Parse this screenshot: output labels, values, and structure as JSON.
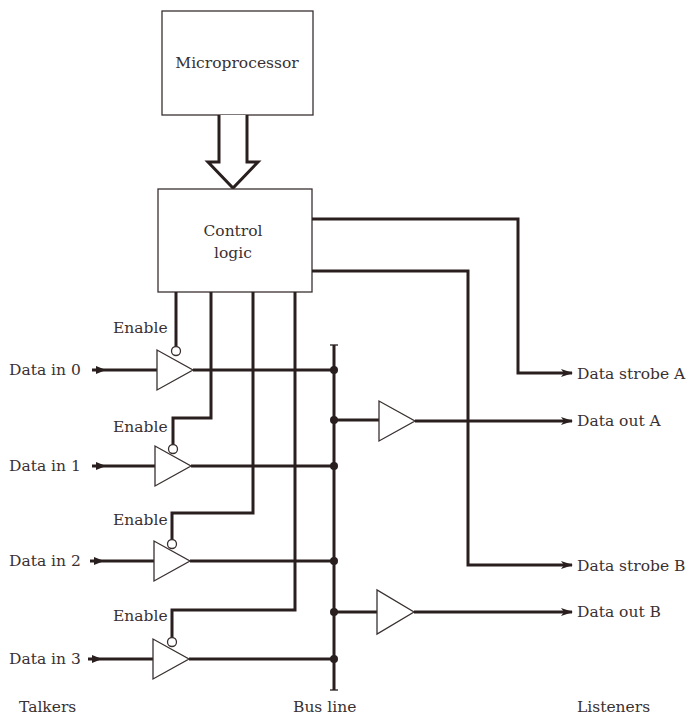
{
  "diagram": {
    "blocks": {
      "microprocessor": "Microprocessor",
      "control_logic_line1": "Control",
      "control_logic_line2": "logic"
    },
    "talkers": {
      "enable_label": "Enable",
      "inputs": [
        "Data in 0",
        "Data in 1",
        "Data in 2",
        "Data in 3"
      ],
      "enable_labels": [
        "Enable",
        "Enable",
        "Enable",
        "Enable"
      ]
    },
    "listeners": {
      "outputs": [
        "Data strobe A",
        "Data out A",
        "Data strobe B",
        "Data out B"
      ]
    },
    "footer": {
      "talkers": "Talkers",
      "bus_line": "Bus line",
      "listeners": "Listeners"
    },
    "colors": {
      "line": "#2a1f1f",
      "text": "#3a3030",
      "background": "#ffffff"
    }
  }
}
